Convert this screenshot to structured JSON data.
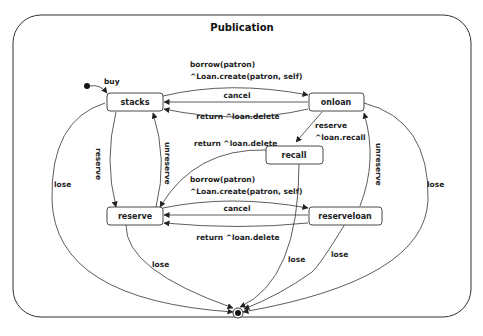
{
  "diagram": {
    "title": "Publication",
    "states": [
      {
        "id": "stacks",
        "label": "stacks"
      },
      {
        "id": "onloan",
        "label": "onloan"
      },
      {
        "id": "recall",
        "label": "recall"
      },
      {
        "id": "reserve",
        "label": "reserve"
      },
      {
        "id": "reserveloan",
        "label": "reserveloan"
      }
    ],
    "transitions": {
      "buy": "buy",
      "stacks_onloan_1": "borrow(patron)",
      "stacks_onloan_2": "^Loan.create(patron, self)",
      "onloan_stacks_cancel": "cancel",
      "onloan_stacks_return": "return ^loan.delete",
      "onloan_recall_1": "reserve",
      "onloan_recall_2": "^loan.recall",
      "recall_reserve_return": "return ^loan.delete",
      "stacks_reserve": "reserve",
      "reserve_stacks": "unreserve",
      "reserveloan_onloan": "unreserve",
      "reserve_reserveloan_1": "borrow(patron)",
      "reserve_reserveloan_2": "^Loan.create(patron, self)",
      "reserveloan_reserve_cancel": "cancel",
      "reserveloan_reserve_return": "return ^loan.delete",
      "lose_stacks": "lose",
      "lose_onloan": "lose",
      "lose_reserve": "lose",
      "lose_recall": "lose",
      "lose_reserveloan": "lose"
    }
  }
}
